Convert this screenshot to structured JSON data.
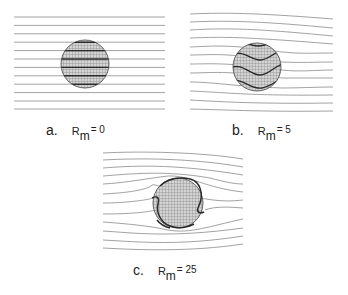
{
  "figure": {
    "panels": [
      {
        "letter": "a.",
        "symbol": "R",
        "subscript": "m",
        "equals": "= 0",
        "value": 0
      },
      {
        "letter": "b.",
        "symbol": "R",
        "subscript": "m",
        "equals": "= 5",
        "value": 5
      },
      {
        "letter": "c.",
        "symbol": "R",
        "subscript": "m",
        "equals": "= 25",
        "value": 25
      }
    ],
    "colors": {
      "field_line": "#8a8a8a",
      "inner_line": "#2a2a2a",
      "circle_fill": "#b8b8b8",
      "circle_edge": "#555555"
    }
  }
}
